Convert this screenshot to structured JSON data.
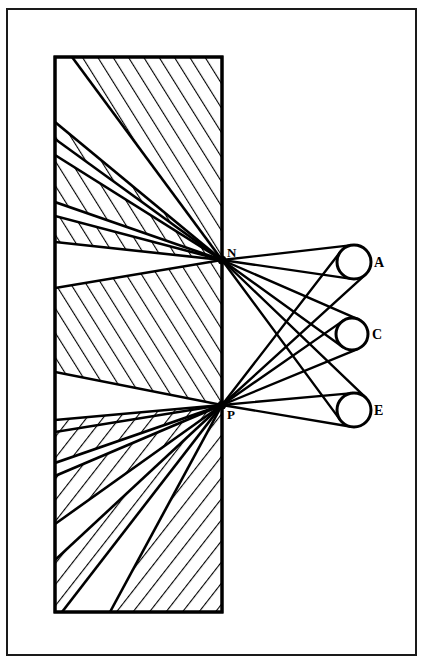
{
  "figure": {
    "domain": "Diagram",
    "canvas": {
      "width": 424,
      "height": 668
    },
    "colors": {
      "ink": "#000000",
      "paper": "#ffffff",
      "frame": "#1a1a1a"
    }
  },
  "frame": {
    "name": "outer-border",
    "x": 7,
    "y": 9,
    "width": 409,
    "height": 646,
    "stroke_width": 2
  },
  "block": {
    "name": "hatched-medium-block",
    "x": 55,
    "y": 57,
    "width": 167,
    "height": 555,
    "stroke_width": 3,
    "hatch_spacing": 13,
    "hatch_stroke_width": 2.2,
    "hatch_angle_upper_deg": -32,
    "hatch_angle_lower_deg": 38
  },
  "points": [
    {
      "id": "N",
      "label": "N",
      "x": 222,
      "y": 260,
      "label_x": 227,
      "label_y": 257,
      "dot_radius": 4
    },
    {
      "id": "P",
      "label": "P",
      "x": 222,
      "y": 405,
      "label_x": 227,
      "label_y": 419,
      "dot_radius": 4
    }
  ],
  "circles": [
    {
      "id": "A",
      "label": "A",
      "cx": 354,
      "cy": 262,
      "r": 17,
      "label_x": 374,
      "label_y": 267,
      "stroke_width": 3
    },
    {
      "id": "C",
      "label": "C",
      "cx": 352,
      "cy": 334,
      "r": 16,
      "label_x": 372,
      "label_y": 339,
      "stroke_width": 3
    },
    {
      "id": "E",
      "label": "E",
      "cx": 354,
      "cy": 410,
      "r": 17,
      "label_x": 374,
      "label_y": 415,
      "stroke_width": 3
    }
  ],
  "ray_bundles": {
    "description": "Pairs of tangent rays run from each vertex point (N, P) to each circle (A, C, E).",
    "from_points": [
      "N",
      "P"
    ],
    "to_circles": [
      "A",
      "C",
      "E"
    ],
    "tangents_per_pair": 2,
    "stroke_width": 2.4
  },
  "internal_rays": {
    "description": "Fan of rays entering the hatched block, converging at N and at P.",
    "stroke_width": 2.6,
    "N_fan_endpoints": [
      {
        "x": 72,
        "y": 57
      },
      {
        "x": 55,
        "y": 122
      },
      {
        "x": 55,
        "y": 139
      },
      {
        "x": 55,
        "y": 155
      },
      {
        "x": 55,
        "y": 202
      },
      {
        "x": 55,
        "y": 216
      },
      {
        "x": 55,
        "y": 242
      },
      {
        "x": 55,
        "y": 288
      }
    ],
    "P_fan_endpoints": [
      {
        "x": 55,
        "y": 372
      },
      {
        "x": 55,
        "y": 420
      },
      {
        "x": 55,
        "y": 432
      },
      {
        "x": 55,
        "y": 463
      },
      {
        "x": 55,
        "y": 476
      },
      {
        "x": 55,
        "y": 524
      },
      {
        "x": 55,
        "y": 560
      },
      {
        "x": 62,
        "y": 612
      },
      {
        "x": 110,
        "y": 612
      }
    ]
  },
  "hatch_bands": {
    "description": "Alternating hatched wedges between adjacent rays inside the block.",
    "upper_filled_indices": [
      0,
      2,
      4,
      6
    ],
    "lower_filled_indices": [
      1,
      3,
      5
    ]
  }
}
